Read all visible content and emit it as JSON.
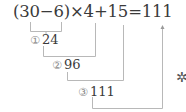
{
  "equation": {
    "text": "(30−6)×4+15=111"
  },
  "steps": [
    {
      "marker": "①",
      "value": "24"
    },
    {
      "marker": "②",
      "value": "96"
    },
    {
      "marker": "③",
      "value": "111"
    }
  ],
  "decoration": {
    "icon": "sparkle-icon",
    "glyph": "✲"
  },
  "colors": {
    "text": "#3a3a3a",
    "lines": "#b8b8b8",
    "marker": "#8a8a8a"
  }
}
